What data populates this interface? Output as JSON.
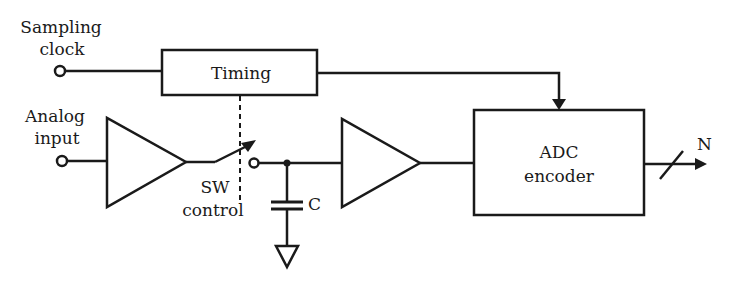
{
  "diagram": {
    "colors": {
      "stroke": "#1a1a1a",
      "background": "#ffffff"
    },
    "inputs": {
      "sampling_clock": {
        "line1": "Sampling",
        "line2": "clock"
      },
      "analog_input": {
        "line1": "Analog",
        "line2": "input"
      }
    },
    "blocks": {
      "timing": {
        "label": "Timing"
      },
      "adc": {
        "line1": "ADC",
        "line2": "encoder"
      }
    },
    "switch": {
      "line1": "SW",
      "line2": "control"
    },
    "capacitor": {
      "label": "C"
    },
    "output": {
      "label": "N"
    }
  }
}
